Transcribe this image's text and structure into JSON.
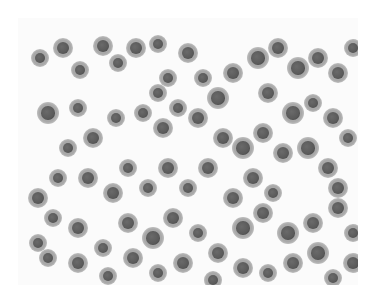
{
  "image": {
    "subject": "microscopy cytology smear",
    "description": "Grayscale micrograph of scattered round cells with dark nuclei on a pale background",
    "background_color": "#fbfbfb",
    "cell_color": "#5a5a5a",
    "cytoplasm_color": "#a8a8a8"
  },
  "cells": [
    [
      22,
      40,
      7
    ],
    [
      45,
      30,
      8
    ],
    [
      62,
      52,
      7
    ],
    [
      85,
      28,
      8
    ],
    [
      100,
      45,
      7
    ],
    [
      118,
      30,
      8
    ],
    [
      140,
      26,
      7
    ],
    [
      150,
      60,
      7
    ],
    [
      170,
      35,
      8
    ],
    [
      30,
      95,
      9
    ],
    [
      60,
      90,
      7
    ],
    [
      75,
      120,
      8
    ],
    [
      98,
      100,
      7
    ],
    [
      125,
      95,
      7
    ],
    [
      145,
      110,
      8
    ],
    [
      160,
      90,
      7
    ],
    [
      180,
      100,
      8
    ],
    [
      200,
      80,
      9
    ],
    [
      215,
      55,
      8
    ],
    [
      240,
      40,
      9
    ],
    [
      260,
      30,
      8
    ],
    [
      280,
      50,
      9
    ],
    [
      300,
      40,
      8
    ],
    [
      320,
      55,
      8
    ],
    [
      335,
      30,
      7
    ],
    [
      250,
      75,
      8
    ],
    [
      275,
      95,
      9
    ],
    [
      295,
      85,
      7
    ],
    [
      315,
      100,
      8
    ],
    [
      330,
      120,
      7
    ],
    [
      205,
      120,
      8
    ],
    [
      225,
      130,
      9
    ],
    [
      245,
      115,
      8
    ],
    [
      265,
      135,
      8
    ],
    [
      290,
      130,
      9
    ],
    [
      310,
      150,
      8
    ],
    [
      190,
      150,
      8
    ],
    [
      170,
      170,
      7
    ],
    [
      150,
      150,
      8
    ],
    [
      130,
      170,
      7
    ],
    [
      110,
      150,
      7
    ],
    [
      95,
      175,
      8
    ],
    [
      70,
      160,
      8
    ],
    [
      40,
      160,
      7
    ],
    [
      20,
      180,
      8
    ],
    [
      35,
      200,
      7
    ],
    [
      60,
      210,
      8
    ],
    [
      85,
      230,
      7
    ],
    [
      110,
      205,
      8
    ],
    [
      135,
      220,
      9
    ],
    [
      155,
      200,
      8
    ],
    [
      180,
      215,
      7
    ],
    [
      200,
      235,
      8
    ],
    [
      225,
      210,
      9
    ],
    [
      245,
      195,
      8
    ],
    [
      270,
      215,
      9
    ],
    [
      295,
      205,
      8
    ],
    [
      320,
      190,
      8
    ],
    [
      335,
      215,
      7
    ],
    [
      300,
      235,
      9
    ],
    [
      275,
      245,
      8
    ],
    [
      250,
      255,
      7
    ],
    [
      225,
      250,
      8
    ],
    [
      195,
      262,
      7
    ],
    [
      165,
      245,
      8
    ],
    [
      140,
      255,
      7
    ],
    [
      115,
      240,
      8
    ],
    [
      90,
      258,
      7
    ],
    [
      60,
      245,
      8
    ],
    [
      30,
      240,
      7
    ],
    [
      20,
      225,
      7
    ],
    [
      50,
      130,
      7
    ],
    [
      140,
      75,
      7
    ],
    [
      185,
      60,
      7
    ],
    [
      235,
      160,
      8
    ],
    [
      255,
      175,
      7
    ],
    [
      215,
      180,
      8
    ],
    [
      320,
      170,
      8
    ],
    [
      335,
      245,
      8
    ],
    [
      315,
      260,
      7
    ]
  ]
}
